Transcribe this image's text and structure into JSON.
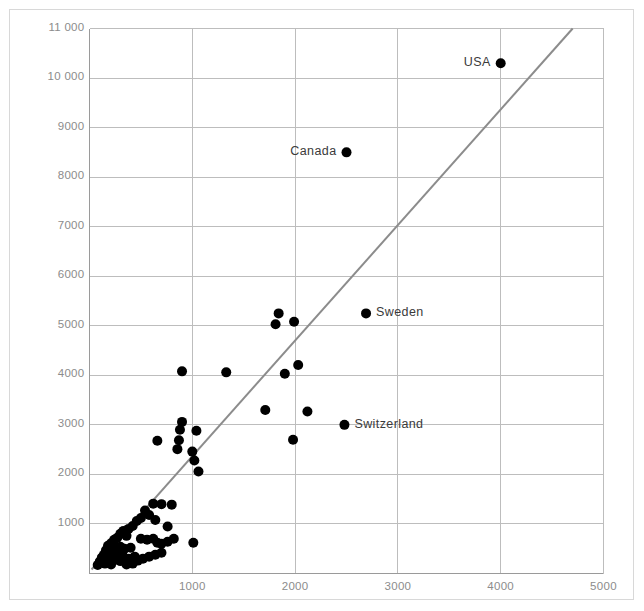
{
  "chart_data": {
    "type": "scatter",
    "title": "",
    "subtitle": "",
    "xlabel": "",
    "ylabel": "",
    "xlim": [
      0,
      5000
    ],
    "ylim": [
      0,
      11000
    ],
    "grid": true,
    "legend": false,
    "legend_position": "none",
    "xticks": [
      1000,
      2000,
      3000,
      4000,
      5000
    ],
    "xtick_labels": [
      "1000",
      "2000",
      "3000",
      "4000",
      "5000"
    ],
    "yticks": [
      1000,
      2000,
      3000,
      4000,
      5000,
      6000,
      7000,
      8000,
      9000,
      10000,
      11000
    ],
    "ytick_labels": [
      "1000",
      "2000",
      "3000",
      "4000",
      "5000",
      "6000",
      "7000",
      "8000",
      "9000",
      "10 000",
      "11 000"
    ],
    "marker": "filled-circle",
    "marker_color": "#000000",
    "marker_size": 10,
    "trendline": {
      "type": "line",
      "color": "#8c8c8c",
      "width": 2,
      "x0": 20,
      "y0": 80,
      "x1": 4700,
      "y1": 11000
    },
    "annotations": [
      {
        "label": "USA",
        "x": 4000,
        "y": 10300,
        "label_side": "left"
      },
      {
        "label": "Canada",
        "x": 2500,
        "y": 8500,
        "label_side": "left"
      },
      {
        "label": "Sweden",
        "x": 2690,
        "y": 5250,
        "label_side": "right"
      },
      {
        "label": "Switzerland",
        "x": 2480,
        "y": 3000,
        "label_side": "right"
      }
    ],
    "points": [
      {
        "x": 4000,
        "y": 10300
      },
      {
        "x": 2500,
        "y": 8500
      },
      {
        "x": 2690,
        "y": 5250
      },
      {
        "x": 2480,
        "y": 3000
      },
      {
        "x": 1840,
        "y": 5250
      },
      {
        "x": 1810,
        "y": 5030
      },
      {
        "x": 1990,
        "y": 5080
      },
      {
        "x": 2030,
        "y": 4210
      },
      {
        "x": 1900,
        "y": 4030
      },
      {
        "x": 1330,
        "y": 4060
      },
      {
        "x": 900,
        "y": 4080
      },
      {
        "x": 1710,
        "y": 3300
      },
      {
        "x": 2120,
        "y": 3270
      },
      {
        "x": 1980,
        "y": 2700
      },
      {
        "x": 900,
        "y": 3060
      },
      {
        "x": 880,
        "y": 2900
      },
      {
        "x": 1040,
        "y": 2880
      },
      {
        "x": 870,
        "y": 2690
      },
      {
        "x": 660,
        "y": 2680
      },
      {
        "x": 855,
        "y": 2510
      },
      {
        "x": 1000,
        "y": 2460
      },
      {
        "x": 1020,
        "y": 2280
      },
      {
        "x": 1060,
        "y": 2060
      },
      {
        "x": 1010,
        "y": 620
      },
      {
        "x": 620,
        "y": 1410
      },
      {
        "x": 700,
        "y": 1400
      },
      {
        "x": 800,
        "y": 1390
      },
      {
        "x": 540,
        "y": 1270
      },
      {
        "x": 580,
        "y": 1180
      },
      {
        "x": 500,
        "y": 1120
      },
      {
        "x": 460,
        "y": 1060
      },
      {
        "x": 640,
        "y": 1080
      },
      {
        "x": 760,
        "y": 950
      },
      {
        "x": 420,
        "y": 960
      },
      {
        "x": 380,
        "y": 900
      },
      {
        "x": 330,
        "y": 860
      },
      {
        "x": 300,
        "y": 800
      },
      {
        "x": 360,
        "y": 760
      },
      {
        "x": 270,
        "y": 720
      },
      {
        "x": 240,
        "y": 680
      },
      {
        "x": 500,
        "y": 700
      },
      {
        "x": 560,
        "y": 680
      },
      {
        "x": 620,
        "y": 700
      },
      {
        "x": 660,
        "y": 620
      },
      {
        "x": 700,
        "y": 600
      },
      {
        "x": 760,
        "y": 640
      },
      {
        "x": 820,
        "y": 700
      },
      {
        "x": 210,
        "y": 610
      },
      {
        "x": 180,
        "y": 560
      },
      {
        "x": 240,
        "y": 520
      },
      {
        "x": 300,
        "y": 540
      },
      {
        "x": 340,
        "y": 500
      },
      {
        "x": 400,
        "y": 520
      },
      {
        "x": 160,
        "y": 470
      },
      {
        "x": 200,
        "y": 430
      },
      {
        "x": 260,
        "y": 400
      },
      {
        "x": 320,
        "y": 380
      },
      {
        "x": 140,
        "y": 380
      },
      {
        "x": 120,
        "y": 320
      },
      {
        "x": 180,
        "y": 300
      },
      {
        "x": 240,
        "y": 270
      },
      {
        "x": 300,
        "y": 250
      },
      {
        "x": 380,
        "y": 300
      },
      {
        "x": 440,
        "y": 340
      },
      {
        "x": 100,
        "y": 240
      },
      {
        "x": 150,
        "y": 200
      },
      {
        "x": 210,
        "y": 180
      },
      {
        "x": 80,
        "y": 170
      },
      {
        "x": 470,
        "y": 260
      },
      {
        "x": 520,
        "y": 300
      },
      {
        "x": 580,
        "y": 340
      },
      {
        "x": 640,
        "y": 380
      },
      {
        "x": 700,
        "y": 420
      },
      {
        "x": 420,
        "y": 200
      },
      {
        "x": 360,
        "y": 180
      }
    ]
  }
}
